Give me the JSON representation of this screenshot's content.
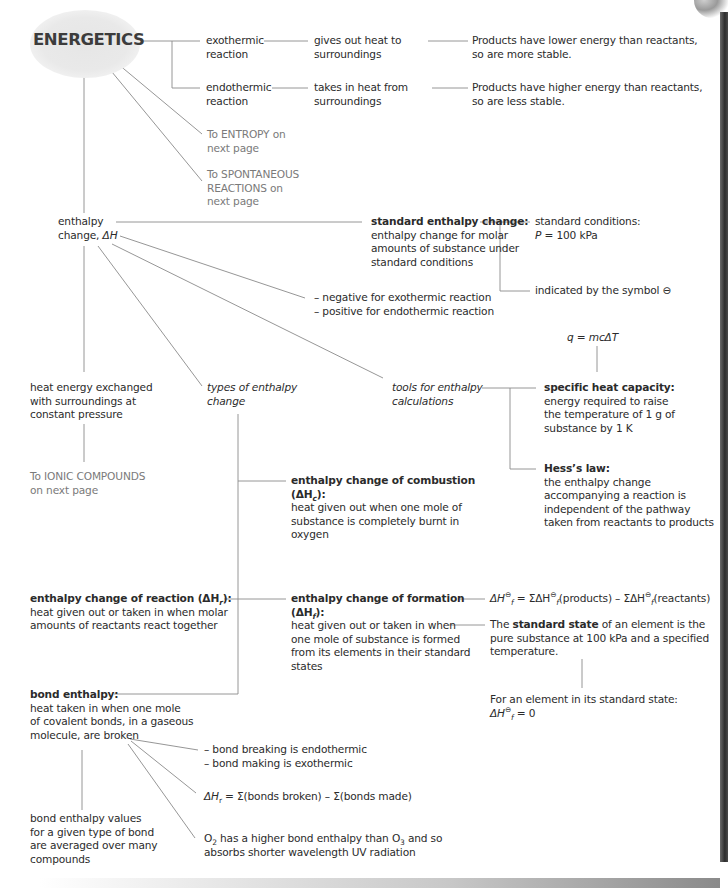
{
  "title": "ENERGETICS",
  "colors": {
    "text": "#2b2b2b",
    "link_text": "#7a7a7a",
    "lines": "#8a8a8a",
    "title_blob": "#e6e6e6"
  },
  "reactions": {
    "exo": {
      "label_l1": "exothermic",
      "label_l2": "reaction",
      "desc_l1": "gives out heat to",
      "desc_l2": "surroundings",
      "result_l1": "Products have lower energy than reactants,",
      "result_l2": "so are more stable."
    },
    "endo": {
      "label_l1": "endothermic",
      "label_l2": "reaction",
      "desc_l1": "takes in heat from",
      "desc_l2": "surroundings",
      "result_l1": "Products have higher energy than reactants,",
      "result_l2": "so are less stable."
    }
  },
  "links": {
    "entropy_l1": "To ENTROPY on",
    "entropy_l2": "next page",
    "spont_l1": "To SPONTANEOUS",
    "spont_l2": "REACTIONS on",
    "spont_l3": "next page",
    "ionic_l1": "To IONIC COMPOUNDS",
    "ionic_l2": "on next page"
  },
  "enthalpy": {
    "label_l1": "enthalpy",
    "label_l2": "change, ",
    "symbol": "ΔH",
    "heat_l1": "heat energy exchanged",
    "heat_l2": "with surroundings at",
    "heat_l3": "constant pressure",
    "sign_l1": "– negative for exothermic reaction",
    "sign_l2": "– positive for endothermic reaction",
    "types_l1": "types of enthalpy",
    "types_l2": "change",
    "tools_l1": "tools for enthalpy",
    "tools_l2": "calculations"
  },
  "standard": {
    "heading": "standard enthalpy change:",
    "body_l1": "enthalpy change for molar",
    "body_l2": "amounts of substance under",
    "body_l3": "standard conditions",
    "cond_l1": "standard conditions:",
    "cond_p": "P",
    "cond_val": " = 100 kPa",
    "symbol_text": "indicated by the symbol ",
    "symbol_glyph": "⊖"
  },
  "tools": {
    "formula": "q = mcΔT",
    "shc_heading": "specific heat capacity:",
    "shc_l1": "energy required to raise",
    "shc_l2": "the temperature of 1 g of",
    "shc_l3": "substance by 1 K",
    "hess_heading": "Hess’s law:",
    "hess_l1": "the enthalpy change",
    "hess_l2": "accompanying a reaction is",
    "hess_l3": "independent of the pathway",
    "hess_l4": "taken from reactants to products"
  },
  "combustion": {
    "heading_l1": "enthalpy change of combustion",
    "heading_l2_pre": "(ΔH",
    "heading_l2_sub": "c",
    "heading_l2_post": "):",
    "body_l1": "heat given out when one mole of",
    "body_l2": "substance is completely burnt in",
    "body_l3": "oxygen"
  },
  "reaction_enthalpy": {
    "heading_pre": "enthalpy change of reaction (ΔH",
    "heading_sub": "r",
    "heading_post": "):",
    "body_l1": "heat given out or taken in when molar",
    "body_l2": "amounts of reactants react together"
  },
  "formation": {
    "heading_l1": "enthalpy change of formation",
    "heading_l2_pre": "(ΔH",
    "heading_l2_sub": "f",
    "heading_l2_post": "):",
    "body_l1": "heat given out or taken in when",
    "body_l2": "one mole of substance is formed",
    "body_l3": "from its elements in their standard",
    "body_l4": "states",
    "equation": "ΔH⊖f = ΣΔH⊖f(products) – ΣΔH⊖f(reactants)",
    "eq_parts": {
      "a": "ΔH",
      "sub": "f",
      "sup": "⊖",
      "b": " = ΣΔH",
      "c": "(products) – ΣΔH",
      "d": "(reactants)"
    },
    "state_pre": "The ",
    "state_bold": "standard state",
    "state_post": " of an element is the",
    "state_l2": "pure substance at 100 kPa and a specified",
    "state_l3": "temperature.",
    "element_l1": "For an element in its standard state:",
    "element_eq_pre": "ΔH",
    "element_eq_post": " = 0"
  },
  "bond": {
    "heading": "bond enthalpy:",
    "body_l1": "heat taken in when one mole",
    "body_l2": "of covalent bonds, in a gaseous",
    "body_l3": "molecule, are broken",
    "avg_l1": "bond enthalpy values",
    "avg_l2": "for a given type of bond",
    "avg_l3": "are averaged over many",
    "avg_l4": "compounds",
    "endo_l1": "– bond breaking is endothermic",
    "endo_l2": "– bond making is exothermic",
    "eq_pre": "ΔH",
    "eq_sub": "r",
    "eq_post": " = Σ(bonds broken) – Σ(bonds made)",
    "ozone_pre": "O",
    "ozone_sub1": "2",
    "ozone_mid": " has a higher bond enthalpy than O",
    "ozone_sub2": "3",
    "ozone_post": " and so",
    "ozone_l2": "absorbs shorter wavelength UV radiation"
  }
}
